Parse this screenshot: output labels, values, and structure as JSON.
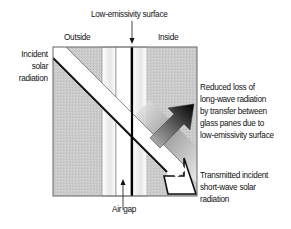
{
  "diagram": {
    "labels": {
      "low_e_surface": "Low-emissivity surface",
      "outside": "Outside",
      "inside": "Inside",
      "incident_line1": "Incident",
      "incident_line2": "solar",
      "incident_line3": "radiation",
      "air_gap": "Air gap",
      "reduced_line1": "Reduced loss of",
      "reduced_line2": "long-wave radiation",
      "reduced_line3": "by transfer between",
      "reduced_line4": "glass panes due to",
      "reduced_line5": "low-emissivity surface",
      "transmitted_line1": "Transmitted incident",
      "transmitted_line2": "short-wave solar",
      "transmitted_line3": "radiation"
    },
    "colors": {
      "outside_fill": "#c9c9c9",
      "inside_fill": "#c9c9c9",
      "glass_fill": "#ffffff",
      "line": "#111111",
      "border": "#666666"
    },
    "elements": {
      "glass_pane_outer": "outer glass pane",
      "glass_pane_inner": "inner glass pane with low-emissivity coating",
      "incident_arrow": "white diagonal arrow - short-wave solar radiation",
      "reflected_arrow": "dark gradient arrow - long-wave radiation"
    }
  }
}
